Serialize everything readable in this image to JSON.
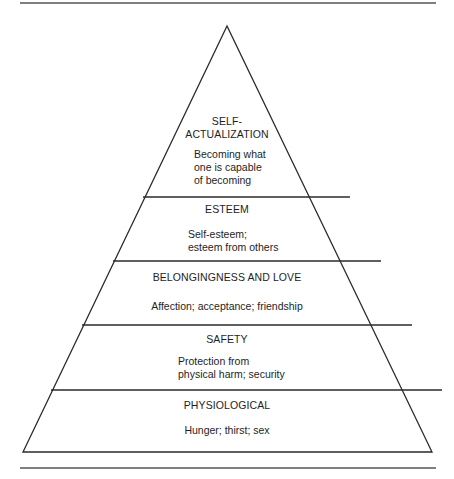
{
  "diagram": {
    "type": "pyramid",
    "levels": [
      {
        "id": "self-actualization",
        "title_line1": "SELF-",
        "title_line2": "ACTUALIZATION",
        "desc_line1": "Becoming what",
        "desc_line2": "one is capable",
        "desc_line3": "of becoming"
      },
      {
        "id": "esteem",
        "title": "ESTEEM",
        "desc_line1": "Self-esteem;",
        "desc_line2": "esteem from others"
      },
      {
        "id": "belongingness",
        "title": "BELONGINGNESS AND LOVE",
        "desc_line1": "Affection; acceptance; friendship"
      },
      {
        "id": "safety",
        "title": "SAFETY",
        "desc_line1": "Protection from",
        "desc_line2": "physical harm; security"
      },
      {
        "id": "physiological",
        "title": "PHYSIOLOGICAL",
        "desc_line1": "Hunger; thirst; sex"
      }
    ]
  },
  "colors": {
    "line": "#2a2a2a",
    "rule": "#555555",
    "background": "#ffffff"
  }
}
